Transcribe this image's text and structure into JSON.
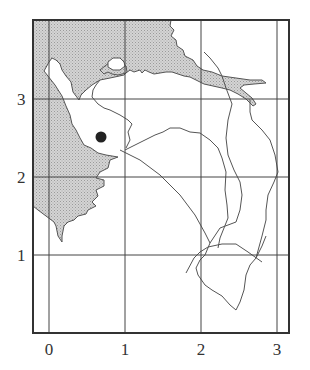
{
  "map": {
    "type": "coastline-map",
    "grid": {
      "x_ticks": [
        "0",
        "1",
        "2",
        "3"
      ],
      "y_ticks": [
        "1",
        "2",
        "3"
      ]
    },
    "legend_colors": {
      "sea_fill": "#c9c9c9",
      "land_fill": "#ffffff",
      "line": "#555555",
      "frame": "#444444"
    },
    "features": {
      "shaded_region": "sea",
      "marker": "filled-circle",
      "rivers_count": 4
    }
  }
}
